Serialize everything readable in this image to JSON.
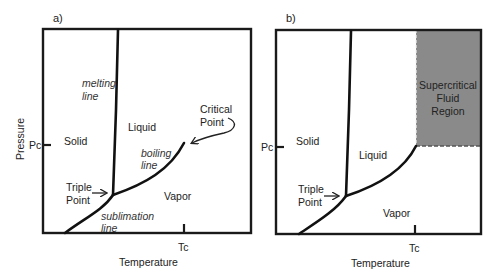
{
  "panels": [
    {
      "tag": "a)",
      "xlabel": "Temperature",
      "ylabel": "Pressure",
      "tick_x": "Tc",
      "tick_y": "Pc",
      "regions": {
        "solid": "Solid",
        "liquid": "Liquid",
        "vapor": "Vapor"
      },
      "lines": {
        "melting_1": "melting",
        "melting_2": "line",
        "boiling_1": "boiling",
        "boiling_2": "line",
        "sublimation_1": "sublimation",
        "sublimation_2": "line"
      },
      "annotations": {
        "triple_1": "Triple",
        "triple_2": "Point",
        "critical_1": "Critical",
        "critical_2": "Point"
      }
    },
    {
      "tag": "b)",
      "xlabel": "Temperature",
      "ylabel": "",
      "tick_x": "Tc",
      "tick_y": "Pc",
      "regions": {
        "solid": "Solid",
        "liquid": "Liquid",
        "vapor": "Vapor"
      },
      "supercritical": {
        "line1": "Supercritical",
        "line2": "Fluid",
        "line3": "Region",
        "color": "#8a8a8a"
      },
      "annotations": {
        "triple_1": "Triple",
        "triple_2": "Point"
      }
    }
  ],
  "colors": {
    "line": "#111111",
    "frame": "#1a1a1a",
    "supercritical_fill": "#8a8a8a"
  }
}
